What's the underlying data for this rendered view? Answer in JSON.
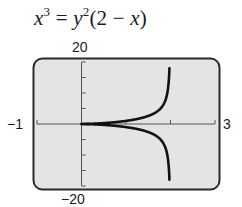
{
  "chart_data": {
    "type": "line",
    "equation": "x^3 = y^2(2 - x)",
    "xlabel": "",
    "ylabel": "",
    "xlim": [
      -1,
      3
    ],
    "ylim": [
      -20,
      20
    ],
    "x_tick_step": 1,
    "y_tick_step": 5,
    "grid": false,
    "tick_labels": {
      "xmin": "−1",
      "xmax": "3",
      "ymin": "−20",
      "ymax": "20"
    },
    "series": [
      {
        "name": "upper branch y = +sqrt(x^3/(2-x))",
        "x": [
          0,
          0.5,
          1,
          1.5,
          1.8,
          1.9,
          1.95,
          1.98
        ],
        "values": [
          0,
          0.29,
          1,
          2.6,
          5.4,
          8.5,
          12.3,
          19.7
        ]
      },
      {
        "name": "lower branch y = -sqrt(x^3/(2-x))",
        "x": [
          0,
          0.5,
          1,
          1.5,
          1.8,
          1.9,
          1.95,
          1.98
        ],
        "values": [
          0,
          -0.29,
          -1,
          -2.6,
          -5.4,
          -8.5,
          -12.3,
          -19.7
        ]
      }
    ],
    "asymptote_x": 2
  },
  "colors": {
    "screen": "#e4e4e4",
    "curve": "#111111",
    "frame": "#2a2a2a",
    "axis": "#555555"
  }
}
